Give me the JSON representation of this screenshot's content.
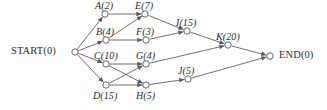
{
  "diagram": {
    "type": "activity-network-diagram",
    "width": 327,
    "height": 110,
    "background_color": "#ffffff",
    "line_color": "#55555c",
    "text_color": "#2b2b30",
    "node_radius": 3.2,
    "nodes": [
      {
        "id": "START",
        "label": "START(0)",
        "name": "START",
        "duration": 0,
        "cx": 75,
        "cy": 52,
        "label_x": 11,
        "label_y": 46,
        "style": "terminal",
        "anchor": "left"
      },
      {
        "id": "A",
        "label": "A(2)",
        "name": "A",
        "duration": 2,
        "cx": 105,
        "cy": 14,
        "label_x": 95,
        "label_y": 1,
        "style": "activity",
        "anchor": "above"
      },
      {
        "id": "E",
        "label": "E(7)",
        "name": "E",
        "duration": 7,
        "cx": 145,
        "cy": 14,
        "label_x": 135,
        "label_y": 1,
        "style": "activity",
        "anchor": "above"
      },
      {
        "id": "B",
        "label": "B(4)",
        "name": "B",
        "duration": 4,
        "cx": 106,
        "cy": 40,
        "label_x": 96,
        "label_y": 27,
        "style": "activity",
        "anchor": "above"
      },
      {
        "id": "F",
        "label": "F(3)",
        "name": "F",
        "duration": 3,
        "cx": 146,
        "cy": 40,
        "label_x": 136,
        "label_y": 27,
        "style": "activity",
        "anchor": "above"
      },
      {
        "id": "I",
        "label": "I(15)",
        "name": "I",
        "duration": 15,
        "cx": 187,
        "cy": 31,
        "label_x": 176,
        "label_y": 18,
        "style": "activity",
        "anchor": "above"
      },
      {
        "id": "C",
        "label": "C(10)",
        "name": "C",
        "duration": 10,
        "cx": 106,
        "cy": 64,
        "label_x": 94,
        "label_y": 51,
        "style": "activity",
        "anchor": "above"
      },
      {
        "id": "G",
        "label": "G(4)",
        "name": "G",
        "duration": 4,
        "cx": 146,
        "cy": 64,
        "label_x": 136,
        "label_y": 51,
        "style": "activity",
        "anchor": "above"
      },
      {
        "id": "K",
        "label": "K(20)",
        "name": "K",
        "duration": 20,
        "cx": 228,
        "cy": 45,
        "label_x": 216,
        "label_y": 32,
        "style": "activity",
        "anchor": "above"
      },
      {
        "id": "D",
        "label": "D(15)",
        "name": "D",
        "duration": 15,
        "cx": 106,
        "cy": 85,
        "label_x": 93,
        "label_y": 91,
        "style": "activity",
        "anchor": "below"
      },
      {
        "id": "H",
        "label": "H(5)",
        "name": "H",
        "duration": 5,
        "cx": 146,
        "cy": 85,
        "label_x": 136,
        "label_y": 91,
        "style": "activity",
        "anchor": "below"
      },
      {
        "id": "J",
        "label": "J(5)",
        "name": "J",
        "duration": 5,
        "cx": 188,
        "cy": 79,
        "label_x": 178,
        "label_y": 66,
        "style": "activity",
        "anchor": "above"
      },
      {
        "id": "END",
        "label": "END(0)",
        "name": "END",
        "duration": 0,
        "cx": 270,
        "cy": 56,
        "label_x": 279,
        "label_y": 50,
        "style": "terminal",
        "anchor": "right"
      }
    ],
    "edges": [
      {
        "from": "START",
        "to": "A"
      },
      {
        "from": "START",
        "to": "B"
      },
      {
        "from": "START",
        "to": "C"
      },
      {
        "from": "START",
        "to": "D"
      },
      {
        "from": "A",
        "to": "E"
      },
      {
        "from": "B",
        "to": "E"
      },
      {
        "from": "B",
        "to": "F"
      },
      {
        "from": "E",
        "to": "I"
      },
      {
        "from": "F",
        "to": "I"
      },
      {
        "from": "C",
        "to": "G"
      },
      {
        "from": "C",
        "to": "H"
      },
      {
        "from": "D",
        "to": "G"
      },
      {
        "from": "D",
        "to": "H"
      },
      {
        "from": "G",
        "to": "K"
      },
      {
        "from": "I",
        "to": "K"
      },
      {
        "from": "H",
        "to": "J"
      },
      {
        "from": "J",
        "to": "END"
      },
      {
        "from": "K",
        "to": "END"
      }
    ]
  }
}
